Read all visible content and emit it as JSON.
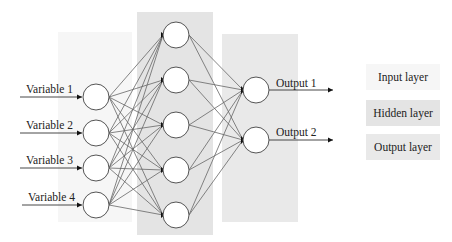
{
  "diagram": {
    "type": "feedforward-neural-network",
    "layers": {
      "input": {
        "name": "Input layer",
        "background": "#f6f6f6",
        "nodes": [
          "Variable 1",
          "Variable 2",
          "Variable 3",
          "Variable 4"
        ]
      },
      "hidden": {
        "name": "Hidden layer",
        "background": "#e4e4e4",
        "node_count": 5
      },
      "output": {
        "name": "Output layer",
        "background": "#e9e9e9",
        "nodes": [
          "Output 1",
          "Output 2"
        ]
      }
    },
    "connections": "fully-connected"
  },
  "inputs": {
    "v1": "Variable 1",
    "v2": "Variable 2",
    "v3": "Variable 3",
    "v4": "Variable 4"
  },
  "outputs": {
    "o1": "Output 1",
    "o2": "Output 2"
  },
  "legend": {
    "input": "Input layer",
    "hidden": "Hidden layer",
    "output": "Output layer"
  },
  "colors": {
    "stroke": "#555555",
    "node_fill": "#ffffff",
    "arrow": "#111111"
  }
}
